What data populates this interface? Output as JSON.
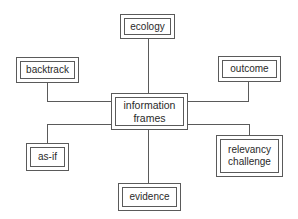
{
  "diagram": {
    "type": "hub-and-spoke concept map",
    "line_color": "#5a5a5a",
    "center": {
      "id": "information-frames",
      "label": "information\nframes"
    },
    "nodes": [
      {
        "id": "ecology",
        "label": "ecology",
        "position": "top"
      },
      {
        "id": "backtrack",
        "label": "backtrack",
        "position": "upper-left"
      },
      {
        "id": "outcome",
        "label": "outcome",
        "position": "upper-right"
      },
      {
        "id": "as-if",
        "label": "as-if",
        "position": "lower-left"
      },
      {
        "id": "evidence",
        "label": "evidence",
        "position": "bottom"
      },
      {
        "id": "relevancy-challenge",
        "label": "relevancy\nchallenge",
        "position": "lower-right"
      }
    ],
    "edges": [
      {
        "from": "information-frames",
        "to": "ecology"
      },
      {
        "from": "information-frames",
        "to": "backtrack"
      },
      {
        "from": "information-frames",
        "to": "outcome"
      },
      {
        "from": "information-frames",
        "to": "as-if"
      },
      {
        "from": "information-frames",
        "to": "evidence"
      },
      {
        "from": "information-frames",
        "to": "relevancy-challenge"
      }
    ]
  }
}
